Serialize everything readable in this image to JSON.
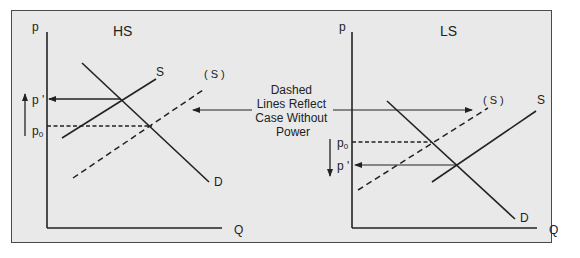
{
  "diagram": {
    "type": "supply-demand-comparison",
    "colors": {
      "background": "#e9e9e9",
      "frame_border": "#4a4a4a",
      "line": "#222222"
    },
    "annotation": {
      "lines": [
        "Dashed",
        "Lines Reflect",
        "Case Without",
        "Power"
      ]
    },
    "panels": [
      {
        "id": "HS",
        "title": "HS",
        "y_axis_label": "p",
        "x_axis_label": "Q",
        "demand_label": "D",
        "supply_label": "S",
        "supply_without_power_label": "( S )",
        "price_with_power_label": "p '",
        "price_without_power_label": "p",
        "price_without_power_subscript": "0",
        "price_change_direction": "up"
      },
      {
        "id": "LS",
        "title": "LS",
        "y_axis_label": "p",
        "x_axis_label": "Q",
        "demand_label": "D",
        "supply_label": "S",
        "supply_without_power_label": "( S )",
        "price_with_power_label": "p '",
        "price_without_power_label": "p",
        "price_without_power_subscript": "0",
        "price_change_direction": "down"
      }
    ]
  }
}
